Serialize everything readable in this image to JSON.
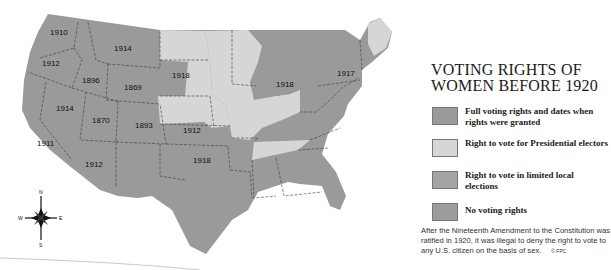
{
  "title": {
    "line1": "VOTING RIGHTS OF",
    "line2": "WOMEN BEFORE 1920"
  },
  "legend": {
    "items": [
      {
        "label": "Full voting rights and dates when rights were granted",
        "color": "#9a9a9a"
      },
      {
        "label": "Right to vote for Presidential electors",
        "color": "#d6d6d6"
      },
      {
        "label": "Right to vote in limited local elections",
        "color": "#a4a4a4"
      },
      {
        "label": "No voting rights",
        "color": "#9c9c9c"
      }
    ]
  },
  "map": {
    "state_years": [
      {
        "label": "1910",
        "x": 50,
        "y": 35
      },
      {
        "label": "1914",
        "x": 114,
        "y": 51
      },
      {
        "label": "1912",
        "x": 42,
        "y": 63
      },
      {
        "label": "1896",
        "x": 82,
        "y": 81
      },
      {
        "label": "1869",
        "x": 126,
        "y": 88
      },
      {
        "label": "1918",
        "x": 172,
        "y": 76
      },
      {
        "label": "1914",
        "x": 56,
        "y": 108
      },
      {
        "label": "1870",
        "x": 92,
        "y": 121
      },
      {
        "label": "1893",
        "x": 135,
        "y": 126
      },
      {
        "label": "1912",
        "x": 183,
        "y": 132
      },
      {
        "label": "1911",
        "x": 37,
        "y": 144
      },
      {
        "label": "1912",
        "x": 85,
        "y": 165
      },
      {
        "label": "1918",
        "x": 193,
        "y": 162
      },
      {
        "label": "1918",
        "x": 276,
        "y": 85
      },
      {
        "label": "1917",
        "x": 337,
        "y": 74
      }
    ],
    "compass": {
      "n": "N",
      "s": "S",
      "e": "E",
      "w": "W"
    }
  },
  "footnote": {
    "text": "After the Nineteenth Amendment to the Constitution was ratified in 1920, it was illegal to deny the right to vote to any U.S. citizen on the basis of sex.",
    "credit": "© FPC"
  }
}
